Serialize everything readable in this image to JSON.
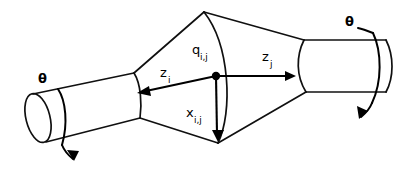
{
  "figure": {
    "background_color": "#ffffff",
    "line_color": "#101010",
    "width": 415,
    "height": 181
  },
  "labels": {
    "joint_origin": {
      "base": "q",
      "sub": "i,j",
      "name": "joint-origin-label"
    },
    "z_axis_i": {
      "base": "z",
      "sub": "i",
      "name": "z-axis-i-label"
    },
    "z_axis_j": {
      "base": "z",
      "sub": "j",
      "name": "z-axis-j-label"
    },
    "x_axis": {
      "base": "x",
      "sub": "i,j",
      "name": "x-axis-label"
    },
    "theta_left": {
      "symbol": "θ",
      "name": "theta-left-label"
    },
    "theta_right": {
      "symbol": "θ",
      "name": "theta-right-label"
    }
  },
  "geometry": {
    "origin_point": {
      "x": 216,
      "y": 76
    },
    "bicone_top_apex": {
      "x": 204,
      "y": 12
    },
    "bicone_bottom_apex": {
      "x": 218,
      "y": 143
    },
    "z_i_arrow_tip": {
      "x": 138,
      "y": 93
    },
    "z_j_arrow_tip": {
      "x": 295,
      "y": 76
    },
    "x_arrow_tip": {
      "x": 218,
      "y": 141
    },
    "left_cylinder": {
      "cap_center_x": 38,
      "cap_center_y": 118,
      "attach_x": 135
    },
    "right_cylinder": {
      "attach_x": 305,
      "end_x": 385,
      "top_y": 40,
      "bottom_y": 92
    }
  }
}
